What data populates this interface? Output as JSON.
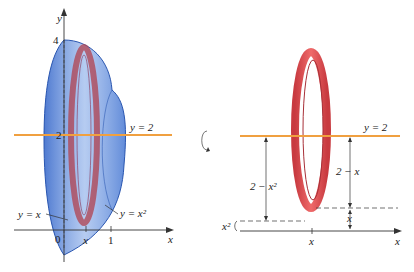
{
  "left_figure": {
    "y_axis_label": "y",
    "x_axis_label": "x",
    "tick_4": "4",
    "tick_2": "2",
    "tick_0": "0",
    "tick_x": "x",
    "tick_1": "1",
    "line_label": "y = 2",
    "curve_label_linear": "y = x",
    "curve_label_quadratic": "y = x²"
  },
  "right_figure": {
    "line_label": "y = 2",
    "outer_radius_label": "2 − x²",
    "inner_radius_label": "2 − x",
    "x_squared_label": "x²",
    "x_gap_label": "x",
    "tick_x": "x",
    "x_axis_label": "x"
  },
  "colors": {
    "solid_blue": "#3b6fd0",
    "ring_red": "#d9454a",
    "line_orange": "#f0a040",
    "axis": "#333333"
  },
  "rotation_icon": "rotation-arrow"
}
